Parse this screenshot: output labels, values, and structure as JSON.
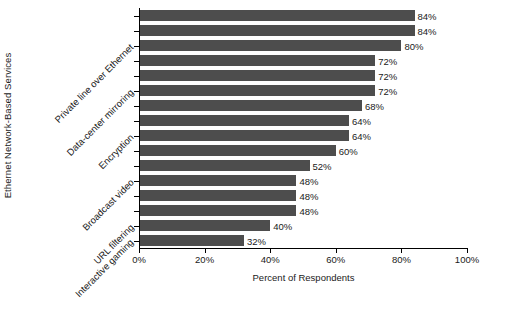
{
  "chart_data": {
    "type": "bar",
    "orientation": "horizontal",
    "title": "",
    "xlabel": "Percent of Respondents",
    "ylabel": "Ethernet Network-Based Services",
    "xlim": [
      0,
      100
    ],
    "grid": false,
    "legend": null,
    "bar_color": "#4d4d4d",
    "xticks": [
      {
        "value": 0,
        "label": "0%"
      },
      {
        "value": 20,
        "label": "20%"
      },
      {
        "value": 40,
        "label": "40%"
      },
      {
        "value": 60,
        "label": "60%"
      },
      {
        "value": 80,
        "label": "80%"
      },
      {
        "value": 100,
        "label": "100%"
      }
    ],
    "categories": [
      "",
      "",
      "Private line over Ethernet",
      "",
      "",
      "Data-center mirroring",
      "",
      "",
      "Encryption",
      "",
      "",
      "Broadcast video",
      "",
      "",
      "URL filtering",
      "Interactive gaming"
    ],
    "values": [
      84,
      84,
      80,
      72,
      72,
      72,
      68,
      64,
      64,
      60,
      52,
      48,
      48,
      48,
      40,
      32
    ],
    "data_labels": [
      "84%",
      "84%",
      "80%",
      "72%",
      "72%",
      "72%",
      "68%",
      "64%",
      "64%",
      "60%",
      "52%",
      "48%",
      "48%",
      "48%",
      "40%",
      "32%"
    ],
    "visible_category_labels": [
      {
        "index": 2,
        "label": "Private line over Ethernet"
      },
      {
        "index": 5,
        "label": "Data-center mirroring"
      },
      {
        "index": 8,
        "label": "Encryption"
      },
      {
        "index": 11,
        "label": "Broadcast video"
      },
      {
        "index": 14,
        "label": "URL filtering"
      },
      {
        "index": 15,
        "label": "Interactive gaming"
      }
    ]
  }
}
